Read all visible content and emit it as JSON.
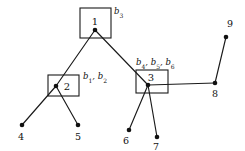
{
  "diagram": {
    "type": "graph-tree",
    "width": 245,
    "height": 151,
    "background_color": "#ffffff",
    "line_color": "#1a1a1a",
    "node_color": "#111111",
    "nodes": [
      {
        "id": "1",
        "label": "1",
        "x": 95,
        "y": 30,
        "boxed": true,
        "label_x": 95,
        "label_y": 25
      },
      {
        "id": "2",
        "label": "2",
        "x": 56,
        "y": 86,
        "boxed": true,
        "label_x": 67,
        "label_y": 90
      },
      {
        "id": "3",
        "label": "3",
        "x": 148,
        "y": 85,
        "boxed": true,
        "label_x": 151,
        "label_y": 81
      },
      {
        "id": "4",
        "label": "4",
        "x": 22,
        "y": 125,
        "boxed": false,
        "label_x": 21,
        "label_y": 140
      },
      {
        "id": "5",
        "label": "5",
        "x": 78,
        "y": 125,
        "boxed": false,
        "label_x": 78,
        "label_y": 140
      },
      {
        "id": "6",
        "label": "6",
        "x": 129,
        "y": 130,
        "boxed": false,
        "label_x": 126,
        "label_y": 144
      },
      {
        "id": "7",
        "label": "7",
        "x": 157,
        "y": 137,
        "boxed": false,
        "label_x": 156,
        "label_y": 150
      },
      {
        "id": "8",
        "label": "8",
        "x": 215,
        "y": 83,
        "boxed": false,
        "label_x": 215,
        "label_y": 97
      },
      {
        "id": "9",
        "label": "9",
        "x": 226,
        "y": 37,
        "boxed": false,
        "label_x": 230,
        "label_y": 27
      }
    ],
    "boxes": [
      {
        "id": "box-1",
        "for_node": "1",
        "x": 80,
        "y": 8,
        "width": 31,
        "height": 30
      },
      {
        "id": "box-2",
        "for_node": "2",
        "x": 48,
        "y": 75,
        "width": 31,
        "height": 21
      },
      {
        "id": "box-3",
        "for_node": "3",
        "x": 136,
        "y": 70,
        "width": 32,
        "height": 23
      }
    ],
    "edges": [
      {
        "id": "edge-1-2",
        "from": "1",
        "to": "2"
      },
      {
        "id": "edge-1-3",
        "from": "1",
        "to": "3"
      },
      {
        "id": "edge-2-4",
        "from": "2",
        "to": "4"
      },
      {
        "id": "edge-2-5",
        "from": "2",
        "to": "5"
      },
      {
        "id": "edge-3-6",
        "from": "3",
        "to": "6"
      },
      {
        "id": "edge-3-7",
        "from": "3",
        "to": "7"
      },
      {
        "id": "edge-3-8",
        "from": "3",
        "to": "8"
      },
      {
        "id": "edge-8-9",
        "from": "8",
        "to": "9"
      }
    ],
    "branch_labels": [
      {
        "id": "branch-label-b3",
        "text": "b3",
        "base": "b",
        "parts": [
          {
            "base": "b",
            "sub": "3"
          }
        ],
        "separator": ", ",
        "x": 114,
        "y": 14,
        "anchor": "start",
        "for_box": "box-1"
      },
      {
        "id": "branch-label-b1-b2",
        "text": "b1, b2",
        "parts": [
          {
            "base": "b",
            "sub": "1"
          },
          {
            "base": "b",
            "sub": "2"
          }
        ],
        "separator": ", ",
        "x": 83,
        "y": 79,
        "anchor": "start",
        "for_box": "box-2"
      },
      {
        "id": "branch-label-b4-b5-b6",
        "text": "b4, b5, b6",
        "parts": [
          {
            "base": "b",
            "sub": "4"
          },
          {
            "base": "b",
            "sub": "5"
          },
          {
            "base": "b",
            "sub": "6"
          }
        ],
        "separator": ", ",
        "x": 136,
        "y": 65,
        "anchor": "start",
        "for_box": "box-3"
      }
    ]
  }
}
